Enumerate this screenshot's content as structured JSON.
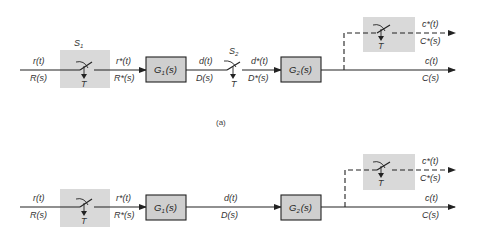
{
  "figure": {
    "caption_a": "(a)",
    "diagram_a": {
      "input": {
        "time": "r(t)",
        "laplace": "R(s)"
      },
      "sampler1": {
        "name": "S",
        "sub": "1",
        "period": "T"
      },
      "sampled_input": {
        "time": "r*(t)",
        "laplace": "R*(s)"
      },
      "block1": {
        "name": "G",
        "sub": "1",
        "arg": "(s)"
      },
      "intermediate": {
        "time": "d(t)",
        "laplace": "D(s)"
      },
      "sampler2": {
        "name": "S",
        "sub": "2",
        "period": "T"
      },
      "sampled_intermediate": {
        "time": "d*(t)",
        "laplace": "D*(s)"
      },
      "block2": {
        "name": "G",
        "sub": "2",
        "arg": "(s)"
      },
      "output_sampler": {
        "period": "T"
      },
      "sampled_output": {
        "time": "c*(t)",
        "laplace": "C*(s)"
      },
      "output": {
        "time": "c(t)",
        "laplace": "C(s)"
      }
    },
    "diagram_b": {
      "input": {
        "time": "r(t)",
        "laplace": "R(s)"
      },
      "sampler1": {
        "period": "T"
      },
      "sampled_input": {
        "time": "r*(t)",
        "laplace": "R*(s)"
      },
      "block1": {
        "name": "G",
        "sub": "1",
        "arg": "(s)"
      },
      "intermediate": {
        "time": "d(t)",
        "laplace": "D(s)"
      },
      "block2": {
        "name": "G",
        "sub": "2",
        "arg": "(s)"
      },
      "output_sampler": {
        "period": "T"
      },
      "sampled_output": {
        "time": "c*(t)",
        "laplace": "C*(s)"
      },
      "output": {
        "time": "c(t)",
        "laplace": "C(s)"
      }
    },
    "colors": {
      "sampler_shade": "#d9d9d9",
      "block_fill": "#cfcfcf",
      "line": "#222222"
    }
  }
}
